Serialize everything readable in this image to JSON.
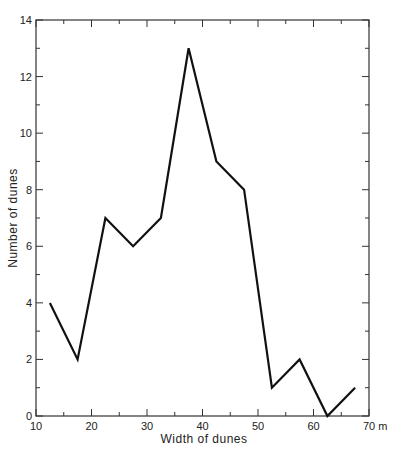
{
  "chart_data": {
    "type": "line",
    "title": "",
    "xlabel": "Width of dunes",
    "ylabel": "Number of dunes",
    "x_unit": "m",
    "xlim": [
      10,
      70
    ],
    "ylim": [
      0,
      14
    ],
    "x_ticks": [
      10,
      20,
      30,
      40,
      50,
      60,
      70
    ],
    "x_tick_labels": [
      "10",
      "20",
      "30",
      "40",
      "50",
      "60",
      "70 m"
    ],
    "x_minor_ticks": [
      15,
      25,
      35,
      45,
      55,
      65
    ],
    "y_ticks": [
      0,
      2,
      4,
      6,
      8,
      10,
      12,
      14
    ],
    "y_tick_labels": [
      "0",
      "2",
      "4",
      "6",
      "8",
      "10",
      "12",
      "14"
    ],
    "y_minor_ticks": [
      1,
      3,
      5,
      7,
      9,
      11,
      13
    ],
    "grid": false,
    "legend": null,
    "series": [
      {
        "name": "Number of dunes",
        "x": [
          12.5,
          17.5,
          22.5,
          27.5,
          32.5,
          37.5,
          42.5,
          47.5,
          52.5,
          57.5,
          62.5,
          67.5
        ],
        "values": [
          4,
          2,
          7,
          6,
          7,
          13,
          9,
          8,
          1,
          2,
          0,
          1
        ],
        "color": "#111111"
      }
    ]
  }
}
